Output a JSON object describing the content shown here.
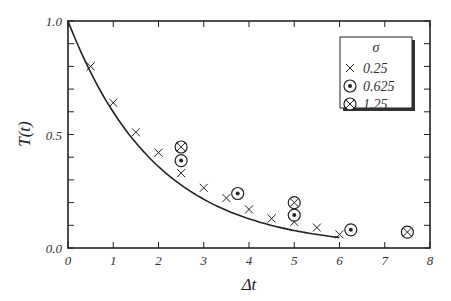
{
  "chart_data": {
    "type": "scatter",
    "title": "",
    "xlabel": "Δt",
    "ylabel": "T(t)",
    "xlim": [
      0,
      8
    ],
    "ylim": [
      0.0,
      1.0
    ],
    "x_ticks": [
      "0",
      "1",
      "2",
      "3",
      "4",
      "5",
      "6",
      "7",
      "8"
    ],
    "y_ticks": [
      "0.0",
      "0.5",
      "1.0"
    ],
    "y_minor_step": 0.1,
    "grid": false,
    "legend": {
      "title": "σ",
      "position": "upper right",
      "entries": [
        {
          "label": "0.25",
          "marker": "cross"
        },
        {
          "label": "0.625",
          "marker": "circle-dot"
        },
        {
          "label": "1.25",
          "marker": "circle-cross"
        }
      ]
    },
    "series": [
      {
        "name": "0.25",
        "marker": "cross",
        "x": [
          0.5,
          1.0,
          1.5,
          2.0,
          2.5,
          3.0,
          3.5,
          4.0,
          4.5,
          5.0,
          5.5,
          6.0
        ],
        "y": [
          0.8,
          0.64,
          0.51,
          0.42,
          0.33,
          0.265,
          0.22,
          0.17,
          0.13,
          0.115,
          0.09,
          0.06
        ]
      },
      {
        "name": "0.625",
        "marker": "circle-dot",
        "x": [
          2.5,
          3.75,
          5.0,
          6.25
        ],
        "y": [
          0.385,
          0.24,
          0.145,
          0.08
        ]
      },
      {
        "name": "1.25",
        "marker": "circle-cross",
        "x": [
          2.5,
          5.0,
          7.5
        ],
        "y": [
          0.445,
          0.2,
          0.07
        ]
      }
    ],
    "curve": {
      "name": "theory",
      "type": "line",
      "formula": "exp(-Δt/1.95)",
      "x_range": [
        0,
        6.0
      ]
    }
  }
}
